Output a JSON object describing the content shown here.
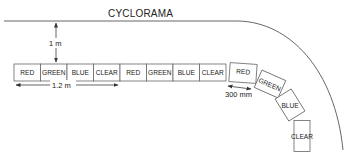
{
  "title": "CYCLORAMA",
  "dimensions": {
    "distance_to_cyc": "1 m",
    "group_width": "1.2 m",
    "unit_spacing": "300 mm"
  },
  "straight_row": [
    {
      "label": "RED"
    },
    {
      "label": "GREEN"
    },
    {
      "label": "BLUE"
    },
    {
      "label": "CLEAR"
    },
    {
      "label": "RED"
    },
    {
      "label": "GREEN"
    },
    {
      "label": "BLUE"
    },
    {
      "label": "CLEAR"
    }
  ],
  "curved_row": [
    {
      "label": "RED"
    },
    {
      "label": "GREEN"
    },
    {
      "label": "BLUE"
    },
    {
      "label": "CLEAR"
    }
  ],
  "colors": {
    "line": "#555555",
    "box_stroke": "#666666",
    "text": "#222222",
    "background": "#ffffff"
  }
}
